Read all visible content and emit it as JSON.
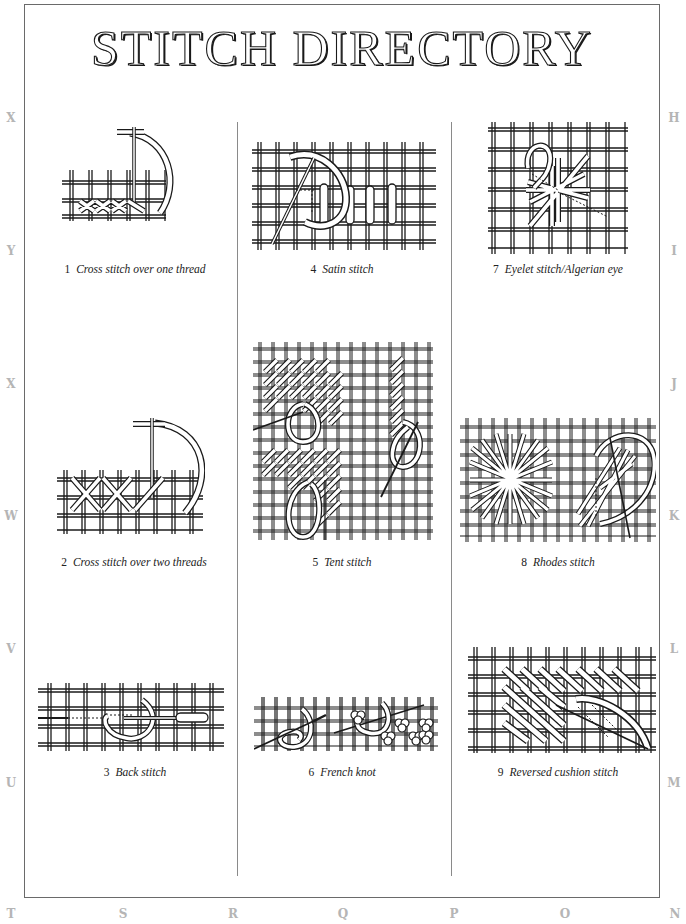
{
  "page": {
    "title": "STITCH DIRECTORY"
  },
  "side_letters": {
    "left": [
      "X",
      "Y",
      "X",
      "W",
      "V",
      "U"
    ],
    "right": [
      "H",
      "I",
      "J",
      "K",
      "L",
      "M"
    ],
    "bottom": [
      "T",
      "S",
      "R",
      "Q",
      "P",
      "O",
      "N"
    ]
  },
  "stitches": [
    {
      "number": "1",
      "name": "Cross stitch over one thread",
      "illustration": "cross-stitch-one-thread-illustration"
    },
    {
      "number": "2",
      "name": "Cross stitch over two threads",
      "illustration": "cross-stitch-two-threads-illustration"
    },
    {
      "number": "3",
      "name": "Back stitch",
      "illustration": "back-stitch-illustration"
    },
    {
      "number": "4",
      "name": "Satin stitch",
      "illustration": "satin-stitch-illustration"
    },
    {
      "number": "5",
      "name": "Tent stitch",
      "illustration": "tent-stitch-illustration"
    },
    {
      "number": "6",
      "name": "French knot",
      "illustration": "french-knot-illustration"
    },
    {
      "number": "7",
      "name": "Eyelet stitch/Algerian eye",
      "illustration": "eyelet-stitch-illustration"
    },
    {
      "number": "8",
      "name": "Rhodes stitch",
      "illustration": "rhodes-stitch-illustration"
    },
    {
      "number": "9",
      "name": "Reversed cushion stitch",
      "illustration": "reversed-cushion-stitch-illustration"
    }
  ],
  "colors": {
    "ink": "#1a1a1a",
    "frame": "#6a6a6a",
    "divider": "#8a8a8a",
    "side_letters": "#b5b5b5",
    "background": "#ffffff"
  }
}
